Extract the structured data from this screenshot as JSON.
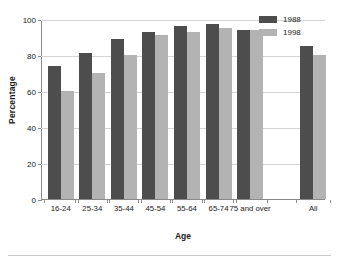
{
  "chart_data": {
    "type": "bar",
    "title": "",
    "xlabel": "Age",
    "ylabel": "Percentage",
    "ylim": [
      0,
      100
    ],
    "yticks": [
      0,
      20,
      40,
      60,
      80,
      100
    ],
    "grid": true,
    "legend_position": "top-right",
    "categories": [
      "16-24",
      "25-34",
      "35-44",
      "45-54",
      "55-64",
      "65-74",
      "75 and over",
      "All"
    ],
    "series": [
      {
        "name": "1988",
        "color": "#4d4d4d",
        "values": [
          74,
          81,
          89,
          93,
          96,
          97,
          94,
          85
        ]
      },
      {
        "name": "1998",
        "color": "#b3b3b3",
        "values": [
          60,
          70,
          80,
          91,
          93,
          95,
          94,
          80
        ]
      }
    ]
  },
  "legend": {
    "items": [
      {
        "label": "1988"
      },
      {
        "label": "1998"
      }
    ]
  },
  "axes": {
    "y_title": "Percentage",
    "x_title": "Age",
    "y_tick_labels": [
      "100",
      "80",
      "60",
      "40",
      "20",
      "0"
    ],
    "x_tick_labels": [
      "16-24",
      "25-34",
      "35-44",
      "45-54",
      "55-64",
      "65-74",
      "75 and over",
      "All"
    ]
  }
}
